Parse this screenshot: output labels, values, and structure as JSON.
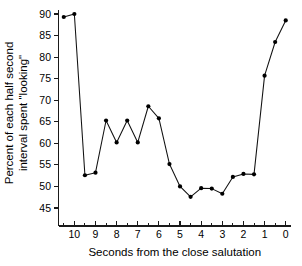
{
  "chart_data": {
    "type": "line",
    "title": "",
    "xlabel": "Seconds from the close salutation",
    "ylabel": "Percent of each half second interval spent \"looking\"",
    "xlim": [
      10.75,
      -0.25
    ],
    "ylim": [
      43.2,
      91.5
    ],
    "x_axis_reversed": true,
    "grid": false,
    "legend": null,
    "x_major_ticks": [
      10,
      9,
      8,
      7,
      6,
      5,
      4,
      3,
      2,
      1,
      0
    ],
    "x_major_tick_labels": [
      "10",
      "9",
      "8",
      "7",
      "6",
      "5",
      "4",
      "3",
      "2",
      "1",
      "0"
    ],
    "x_minor_ticks": [
      10.5,
      9.5,
      8.5,
      7.5,
      6.5,
      5.5,
      4.5,
      3.5,
      2.5,
      1.5,
      0.5
    ],
    "y_ticks": [
      45,
      50,
      55,
      60,
      65,
      70,
      75,
      80,
      85,
      90
    ],
    "y_tick_labels": [
      "45",
      "50",
      "55",
      "60",
      "65",
      "70",
      "75",
      "80",
      "85",
      "90"
    ],
    "marker": "filled-circle",
    "x": [
      10.5,
      10.0,
      9.5,
      9.0,
      8.5,
      8.0,
      7.5,
      7.0,
      6.5,
      6.0,
      5.5,
      5.0,
      4.5,
      4.0,
      3.5,
      3.0,
      2.5,
      2.0,
      1.5,
      1.0,
      0.5,
      0.0
    ],
    "values": [
      89.3,
      90.0,
      52.6,
      53.2,
      65.3,
      60.2,
      65.3,
      60.2,
      68.6,
      65.8,
      55.2,
      50.0,
      47.6,
      49.6,
      49.5,
      48.3,
      52.2,
      52.9,
      52.8,
      75.7,
      83.5,
      88.5
    ],
    "points": [
      {
        "x": 10.5,
        "y": 89.3
      },
      {
        "x": 10.0,
        "y": 90.0
      },
      {
        "x": 9.5,
        "y": 52.6
      },
      {
        "x": 9.0,
        "y": 53.2
      },
      {
        "x": 8.5,
        "y": 65.3
      },
      {
        "x": 8.0,
        "y": 60.2
      },
      {
        "x": 7.5,
        "y": 65.3
      },
      {
        "x": 7.0,
        "y": 60.2
      },
      {
        "x": 6.5,
        "y": 68.6
      },
      {
        "x": 6.0,
        "y": 65.8
      },
      {
        "x": 5.5,
        "y": 55.2
      },
      {
        "x": 5.0,
        "y": 50.0
      },
      {
        "x": 4.5,
        "y": 47.6
      },
      {
        "x": 4.0,
        "y": 49.6
      },
      {
        "x": 3.5,
        "y": 49.5
      },
      {
        "x": 3.0,
        "y": 48.3
      },
      {
        "x": 2.5,
        "y": 52.2
      },
      {
        "x": 2.0,
        "y": 52.9
      },
      {
        "x": 1.5,
        "y": 52.8
      },
      {
        "x": 1.0,
        "y": 75.7
      },
      {
        "x": 0.5,
        "y": 83.5
      },
      {
        "x": 0.0,
        "y": 88.5
      }
    ],
    "colors": {
      "line": "#111111",
      "marker": "#000000",
      "axis": "#1a1a1a",
      "background": "#ffffff"
    }
  }
}
